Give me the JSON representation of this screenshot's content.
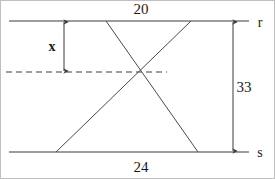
{
  "figure": {
    "background_color": "#ffffff",
    "stroke_color": "#3c3c3c",
    "text_color": "#1a1a1a",
    "border_color": "#bfbfbf",
    "width": 275,
    "height": 179
  },
  "labels": {
    "top_measure": "20",
    "bottom_measure": "24",
    "right_measure": "33",
    "unknown_measure": "x",
    "top_line_name": "r",
    "bottom_line_name": "s"
  },
  "geometry": {
    "line_r": {
      "x1": 8,
      "y1": 20,
      "x2": 248,
      "y2": 20
    },
    "line_s": {
      "x1": 8,
      "y1": 151,
      "x2": 248,
      "y2": 151
    },
    "dashed_line": {
      "x1": 5,
      "y1": 71,
      "x2": 166,
      "y2": 71
    },
    "transversal_a": {
      "x1": 105,
      "y1": 20,
      "x2": 197,
      "y2": 151
    },
    "transversal_b": {
      "x1": 190,
      "y1": 20,
      "x2": 55,
      "y2": 151
    },
    "intersection_point": {
      "x": 140,
      "y": 71
    },
    "arrow_x": {
      "x": 63,
      "y1": 21,
      "y2": 70
    },
    "arrow_33": {
      "x": 232,
      "y1": 21,
      "y2": 151
    }
  },
  "label_positions": {
    "top_measure": {
      "x": 140,
      "y": 8
    },
    "bottom_measure": {
      "x": 140,
      "y": 166
    },
    "right_measure": {
      "x": 243,
      "y": 86
    },
    "unknown_measure": {
      "x": 51,
      "y": 46
    },
    "top_line_name": {
      "x": 259,
      "y": 22
    },
    "bottom_line_name": {
      "x": 259,
      "y": 152
    }
  }
}
